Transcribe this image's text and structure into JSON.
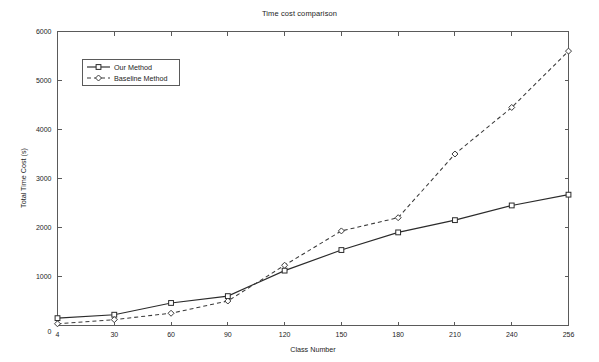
{
  "figure": {
    "title": "Time cost comparison",
    "background": "#ffffff",
    "width": 599,
    "height": 362
  },
  "chart_data": {
    "type": "line",
    "title": "Time cost comparison",
    "xlabel": "Class Number",
    "ylabel": "Total Time Cost (s)",
    "categories": [
      "4",
      "30",
      "60",
      "90",
      "120",
      "150",
      "180",
      "210",
      "240",
      "256"
    ],
    "x_tick_labels": [
      "4",
      "30",
      "60",
      "90",
      "120",
      "150",
      "180",
      "210",
      "240",
      "256"
    ],
    "y_tick_labels": [
      "0",
      "1000",
      "2000",
      "3000",
      "4000",
      "5000",
      "6000"
    ],
    "y_ticks": [
      0,
      1000,
      2000,
      3000,
      4000,
      5000,
      6000
    ],
    "ylim": [
      0,
      6000
    ],
    "grid": false,
    "legend_position": "upper left",
    "series": [
      {
        "name": "Our Method",
        "line_style": "solid",
        "marker": "square",
        "color": "#2b2b2b",
        "values": [
          150,
          220,
          460,
          600,
          1120,
          1540,
          1900,
          2150,
          2450,
          2670
        ]
      },
      {
        "name": "Baseline Method",
        "line_style": "dashed",
        "marker": "diamond",
        "color": "#3a3a3a",
        "values": [
          35,
          120,
          250,
          500,
          1230,
          1930,
          2200,
          3500,
          4450,
          5600
        ]
      }
    ]
  },
  "legend": {
    "entries": [
      {
        "label": "Our Method",
        "marker": "square",
        "style": "solid"
      },
      {
        "label": "Baseline Method",
        "marker": "diamond",
        "style": "dashed"
      }
    ]
  }
}
